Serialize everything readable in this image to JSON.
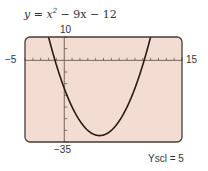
{
  "chart_data": {
    "type": "line",
    "equation": {
      "var": "y",
      "term1": "x",
      "exp": "2",
      "rest": " − 9x − 12"
    },
    "function": "x^2 - 9x - 12",
    "xlim": [
      -5,
      15
    ],
    "ylim": [
      -35,
      10
    ],
    "xscl": 1,
    "yscl": 5,
    "tick_labels": {
      "xmin": "−5",
      "xmax": "15",
      "ymax": "10",
      "ymin": "−35"
    },
    "yscl_label": "Yscl = 5",
    "grid": false,
    "frame_color": "#4a3a35",
    "background_color": "#f3ddd2",
    "curve_color": "#2b1a14"
  }
}
